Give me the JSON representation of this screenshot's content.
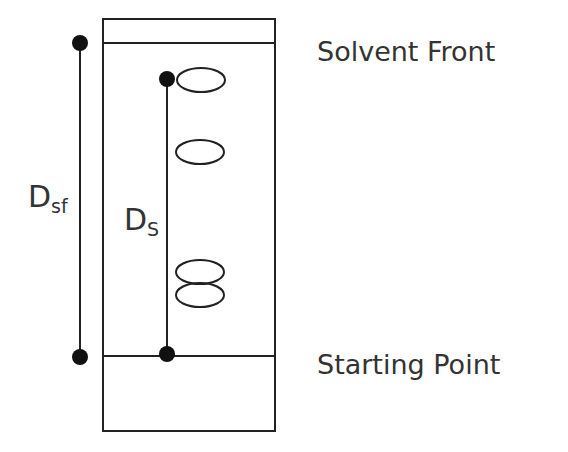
{
  "diagram": {
    "labels": {
      "solvent_front": "Solvent Front",
      "starting_point": "Starting Point",
      "dsf_main": "D",
      "dsf_sub": "sf",
      "ds_main": "D",
      "ds_sub": "S"
    },
    "plate": {
      "x": 103,
      "y": 19,
      "width": 172,
      "height": 412
    },
    "lines": {
      "solvent_front_y": 43,
      "starting_line_y": 356
    },
    "spots": [
      {
        "cx": 208,
        "cy": 80,
        "rx": 24,
        "ry": 12
      },
      {
        "cx": 200,
        "cy": 152,
        "rx": 24,
        "ry": 12
      },
      {
        "cx": 200,
        "cy": 271,
        "rx": 24,
        "ry": 12
      },
      {
        "cx": 200,
        "cy": 296,
        "rx": 24,
        "ry": 12
      }
    ],
    "colors": {
      "stroke": "#222222",
      "text": "#333333"
    }
  }
}
